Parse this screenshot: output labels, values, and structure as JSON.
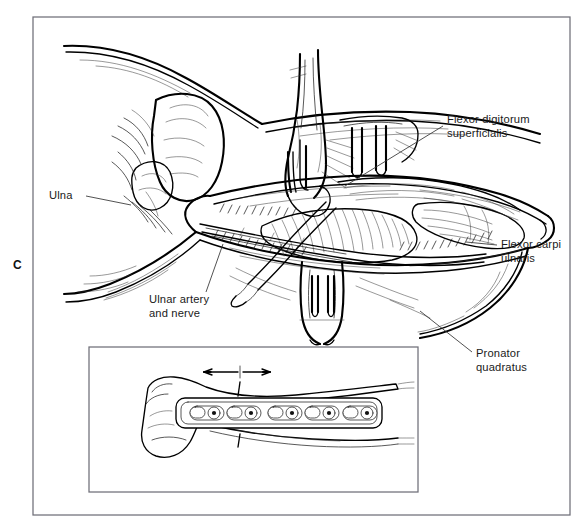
{
  "figure": {
    "panel_letter": "C",
    "background_color": "#ffffff",
    "ink_color": "#111111",
    "frame_color": "#6f6f78"
  },
  "labels": [
    {
      "id": "flexor-digitorum-superficialis",
      "lines": [
        "Flexor digitorum",
        "superficialis"
      ],
      "text_x": 447,
      "text_y": 123,
      "leader": "M 443 126 L 345 186"
    },
    {
      "id": "ulna",
      "lines": [
        "Ulna"
      ],
      "text_x": 49,
      "text_y": 199,
      "leader": "M 86 196 L 131 205"
    },
    {
      "id": "flexor-carpi-ulnaris",
      "lines": [
        "Flexor carpi",
        "ulnaris"
      ],
      "text_x": 500,
      "text_y": 248,
      "leader": "M 497 245 L 468 242"
    },
    {
      "id": "ulnar-artery-and-nerve",
      "lines": [
        "Ulnar artery",
        "and nerve"
      ],
      "text_x": 149,
      "text_y": 303,
      "leader": "M 205 292 L 222 245"
    },
    {
      "id": "pronator-quadratus",
      "lines": [
        "Pronator",
        "quadratus"
      ],
      "text_x": 476,
      "text_y": 357,
      "leader": "M 472 352 L 420 311"
    }
  ],
  "outer_frame": {
    "x": 33,
    "y": 17,
    "width": 537,
    "height": 498
  },
  "inset": {
    "name": "plate-fixation-inset",
    "x": 89,
    "y": 347,
    "width": 329,
    "height": 145,
    "screw_count": 5,
    "arrow": {
      "label": "compression-arrows",
      "x1": 206,
      "y1": 372,
      "x2": 268,
      "y2": 372
    },
    "fracture_line": "distal ulna osteotomy"
  }
}
